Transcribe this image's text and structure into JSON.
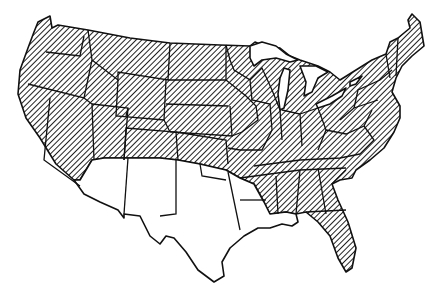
{
  "map": {
    "subject": "Contiguous United States",
    "legend_visible": false,
    "colors": {
      "hatched_fill": "#444444",
      "background": "#ffffff",
      "outline": "#111111"
    },
    "regions": [
      {
        "name": "Hatched region",
        "pattern": "diagonal-hatch",
        "description": "Most of the contiguous United States"
      },
      {
        "name": "Unhatched region",
        "pattern": "none",
        "description": "Southern band: southern California, Arizona, New Mexico, Texas, southern Oklahoma, Louisiana, southern Mississippi"
      }
    ]
  }
}
